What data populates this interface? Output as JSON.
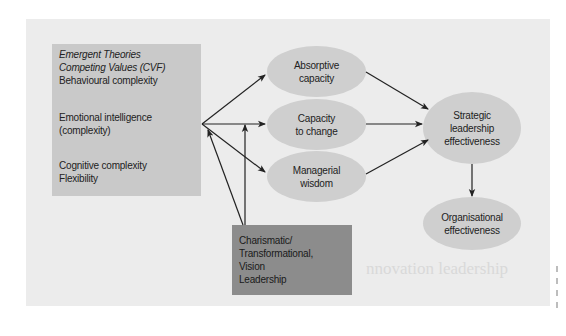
{
  "diagram": {
    "left_box": {
      "lines": [
        {
          "text": "Emergent Theories",
          "italic": true
        },
        {
          "text": "Competing Values (CVF)",
          "italic": true
        },
        {
          "text": "Behavioural complexity",
          "italic": false
        },
        {
          "text": "Emotional intelligence",
          "italic": false
        },
        {
          "text": "(complexity)",
          "italic": false
        },
        {
          "text": "Cognitive complexity",
          "italic": false
        },
        {
          "text": "Flexibility",
          "italic": false
        }
      ]
    },
    "bottom_box": {
      "lines": [
        "Charismatic/",
        "Transformational,",
        "Vision",
        "Leadership"
      ]
    },
    "nodes": {
      "absorptive": {
        "line1": "Absorptive",
        "line2": "capacity"
      },
      "capacity_change": {
        "line1": "Capacity",
        "line2": "to change"
      },
      "managerial": {
        "line1": "Managerial",
        "line2": "wisdom"
      },
      "strategic": {
        "line1": "Strategic",
        "line2": "leadership",
        "line3": "effectiveness"
      },
      "organisational": {
        "line1": "Organisational",
        "line2": "effectiveness"
      }
    },
    "edges": [
      {
        "from": "left_box",
        "to": "absorptive"
      },
      {
        "from": "left_box",
        "to": "capacity_change"
      },
      {
        "from": "left_box",
        "to": "managerial"
      },
      {
        "from": "bottom_box",
        "to": "left_box"
      },
      {
        "from": "bottom_box",
        "to": "capacity_change"
      },
      {
        "from": "absorptive",
        "to": "strategic"
      },
      {
        "from": "capacity_change",
        "to": "strategic"
      },
      {
        "from": "managerial",
        "to": "strategic"
      },
      {
        "from": "strategic",
        "to": "organisational"
      }
    ],
    "colors": {
      "panel": "#ececec",
      "left_box": "#c9c9c9",
      "bottom_box": "#8c8c8c",
      "ellipse": "#cfcfcf",
      "arrow": "#222222"
    }
  },
  "background": {
    "bleed_heading": "nnovation leadership"
  }
}
